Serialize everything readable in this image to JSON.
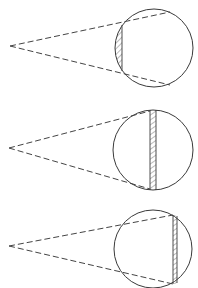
{
  "diagram": {
    "type": "geometric-illustration",
    "colors": {
      "line": "#3a3a3a",
      "background": "#ffffff"
    },
    "panels": [
      {
        "id": "panel-1",
        "apex": [
          10,
          46
        ],
        "circle": {
          "cx": 154,
          "cy": 48,
          "r": 39
        },
        "rays": [
          [
            10,
            46,
            170,
            12
          ],
          [
            10,
            46,
            170,
            85
          ]
        ],
        "hatch": {
          "kind": "circular-segment",
          "chord_x": 122,
          "y_top": 25,
          "y_bottom": 71
        }
      },
      {
        "id": "panel-2",
        "apex": [
          9,
          148
        ],
        "circle": {
          "cx": 153,
          "cy": 150,
          "r": 40
        },
        "rays": [
          [
            9,
            148,
            150,
            111
          ],
          [
            9,
            148,
            150,
            189
          ]
        ],
        "hatch": {
          "kind": "strip",
          "x": 150,
          "width": 6,
          "y_top": 110,
          "y_bottom": 190
        }
      },
      {
        "id": "panel-3",
        "apex": [
          9,
          246
        ],
        "circle": {
          "cx": 153,
          "cy": 249,
          "r": 39
        },
        "rays": [
          [
            9,
            246,
            173,
            215
          ],
          [
            9,
            246,
            173,
            284
          ]
        ],
        "hatch": {
          "kind": "strip",
          "x": 173,
          "width": 4,
          "y_top": 215,
          "y_bottom": 284
        }
      }
    ]
  }
}
